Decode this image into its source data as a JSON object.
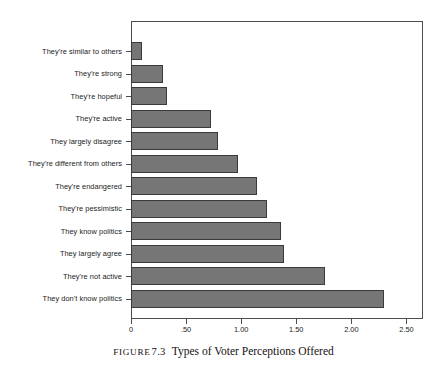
{
  "caption": {
    "label": "FIGURE",
    "number": "7.3",
    "title": "Types of Voter Perceptions Offered"
  },
  "chart_data": {
    "type": "bar",
    "orientation": "horizontal",
    "title": "Types of Voter Perceptions Offered",
    "xlabel": "",
    "ylabel": "",
    "xlim": [
      0,
      2.65
    ],
    "xticks": [
      0,
      0.5,
      1.0,
      1.5,
      2.0,
      2.5
    ],
    "xticklabels": [
      "0",
      ".50",
      "1.00",
      "1.50",
      "2.00",
      "2.50"
    ],
    "grid": false,
    "legend": null,
    "bar_color": "#767676",
    "bar_edge_color": "#3a3a3a",
    "frame_color": "#4d4d4d",
    "categories": [
      "They're similar to others",
      "They're strong",
      "They're hopeful",
      "They're active",
      "They largely disagree",
      "They're different from others",
      "They're endangered",
      "They're pessimistic",
      "They know politics",
      "They largely agree",
      "They're not active",
      "They don't know politics"
    ],
    "values": [
      0.1,
      0.29,
      0.33,
      0.73,
      0.79,
      0.97,
      1.14,
      1.23,
      1.36,
      1.39,
      1.76,
      2.3
    ]
  }
}
